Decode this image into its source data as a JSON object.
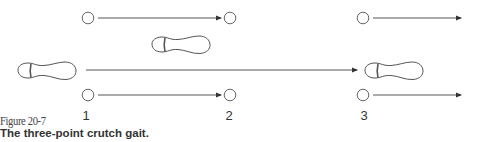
{
  "figure": {
    "number": "Figure 20-7",
    "title": "The three-point crutch gait."
  },
  "steps": [
    {
      "label": "1",
      "x": 86
    },
    {
      "label": "2",
      "x": 229
    },
    {
      "label": "3",
      "x": 364
    }
  ],
  "colors": {
    "stroke": "#555555",
    "text": "#333333",
    "background": "#ffffff"
  },
  "elements": {
    "crutch_tips": [
      {
        "id": "top-1",
        "cx": 88,
        "cy": 18
      },
      {
        "id": "top-2",
        "cx": 230,
        "cy": 18
      },
      {
        "id": "top-3",
        "cx": 363,
        "cy": 18
      },
      {
        "id": "bottom-1",
        "cx": 88,
        "cy": 95
      },
      {
        "id": "bottom-2",
        "cx": 230,
        "cy": 95
      },
      {
        "id": "bottom-3",
        "cx": 363,
        "cy": 95
      }
    ],
    "arrows": [
      {
        "id": "top-1-2",
        "x1": 98,
        "y": 18,
        "x2": 221
      },
      {
        "id": "top-3-out",
        "x1": 373,
        "y": 18,
        "x2": 461
      },
      {
        "id": "foot-long",
        "x1": 86,
        "y": 70,
        "x2": 357
      },
      {
        "id": "bottom-1-2",
        "x1": 98,
        "y": 95,
        "x2": 221
      },
      {
        "id": "bottom-3-out",
        "x1": 373,
        "y": 95,
        "x2": 461
      }
    ],
    "feet": [
      {
        "id": "foot-start",
        "x": 18,
        "y": 62
      },
      {
        "id": "foot-middle",
        "x": 152,
        "y": 36
      },
      {
        "id": "foot-end",
        "x": 365,
        "y": 62
      }
    ]
  }
}
